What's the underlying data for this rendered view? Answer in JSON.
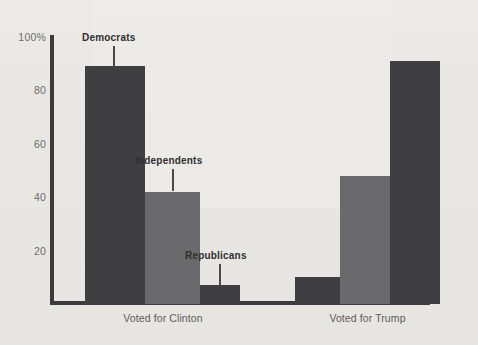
{
  "chart_data": {
    "type": "bar",
    "title": "",
    "subtitle": "",
    "xlabel": "",
    "ylabel": "",
    "ylim": [
      0,
      100
    ],
    "grid": false,
    "legend_position": "none",
    "categories": [
      "Voted for Clinton",
      "Voted for Trump"
    ],
    "series": [
      {
        "name": "Democrats",
        "values": [
          89,
          10
        ],
        "color": "#3f3f41"
      },
      {
        "name": "Independents",
        "values": [
          42,
          48
        ],
        "color": "#6a6a6c"
      },
      {
        "name": "Republicans",
        "values": [
          7,
          91
        ],
        "color": "#3f3f41"
      }
    ],
    "y_ticks": [
      {
        "value": 100,
        "label": "100%"
      },
      {
        "value": 80,
        "label": "80"
      },
      {
        "value": 60,
        "label": "60"
      },
      {
        "value": 40,
        "label": "40"
      },
      {
        "value": 20,
        "label": "20"
      }
    ],
    "annotations": [
      {
        "text": "Democrats",
        "target_group": "Voted for Clinton",
        "target_series": "Democrats"
      },
      {
        "text": "Independents",
        "target_group": "Voted for Clinton",
        "target_series": "Independents"
      },
      {
        "text": "Republicans",
        "target_group": "Voted for Clinton",
        "target_series": "Republicans"
      }
    ]
  },
  "colors": {
    "background": "#e9e7e4",
    "axis": "#3b3b3d",
    "dark_bar": "#3f3f41",
    "medium_bar": "#6a6a6c",
    "tick_text": "#6d6b69",
    "group_text": "#5e5c5a",
    "annotation_text": "#2f2f31"
  },
  "ticks": {
    "t100": "100%",
    "t80": "80",
    "t60": "60",
    "t40": "40",
    "t20": "20"
  },
  "groups": {
    "clinton": "Voted for Clinton",
    "trump": "Voted for Trump"
  },
  "annotations": {
    "democrats": "Democrats",
    "independents": "Independents",
    "republicans": "Republicans"
  }
}
